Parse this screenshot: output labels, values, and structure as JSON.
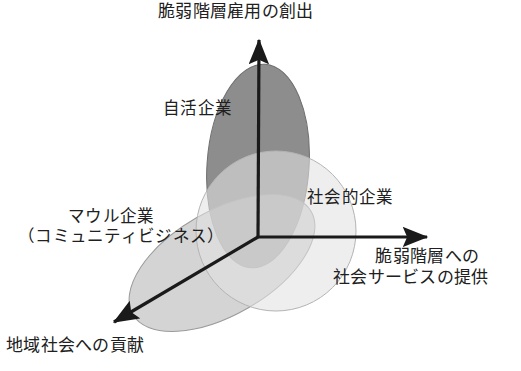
{
  "diagram": {
    "title_text": "脆弱階層雇用の創出",
    "background_color": "#ffffff",
    "axes": {
      "stroke_color": "#1a1a1a",
      "origin": {
        "x": 258,
        "y": 237
      },
      "items": [
        {
          "name": "vertical-axis",
          "label": "脆弱階層雇用の創出",
          "direction": "up",
          "from": {
            "x": 258,
            "y": 237
          },
          "to": {
            "x": 259,
            "y": 32
          }
        },
        {
          "name": "horizontal-axis",
          "label_line1": "脆弱階層への",
          "label_line2": "社会サービスの提供",
          "direction": "right",
          "from": {
            "x": 258,
            "y": 237
          },
          "to": {
            "x": 436,
            "y": 237
          }
        },
        {
          "name": "diagonal-axis",
          "label": "地域社会への貢献",
          "direction": "down-left",
          "from": {
            "x": 258,
            "y": 237
          },
          "to": {
            "x": 106,
            "y": 327
          }
        }
      ]
    },
    "sets": [
      {
        "name": "jikatsu-enterprise",
        "label": "自活企業",
        "shape": "ellipse",
        "fill": "#7d7d7d",
        "stroke": "#6e6e6e",
        "cx": 258,
        "cy": 166,
        "rx": 51,
        "ry": 102,
        "rotation": 4
      },
      {
        "name": "social-enterprise",
        "label": "社会的企業",
        "shape": "circle",
        "fill": "#e2e2e2",
        "stroke": "#b4b4b4",
        "cx": 276,
        "cy": 231,
        "rx": 80,
        "ry": 81,
        "rotation": 0
      },
      {
        "name": "maul-community-business",
        "label_line1": "マウル企業",
        "label_line2": "（コミュニティビジネス）",
        "shape": "ellipse",
        "fill": "#b9b9b9",
        "stroke": "#9a9a9a",
        "cx": 222,
        "cy": 263,
        "rx": 103,
        "ry": 52,
        "rotation": -30
      }
    ]
  }
}
